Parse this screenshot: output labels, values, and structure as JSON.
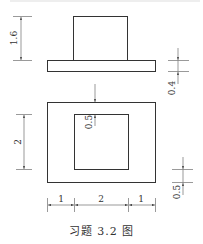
{
  "figure": {
    "caption": "习题 3.2 图",
    "line_color": "#333333",
    "front_view": {
      "dims": {
        "upper_height": "1.6",
        "base_thickness": "0.4"
      }
    },
    "top_view": {
      "dims": {
        "inner_height": "2",
        "top_offset": "0.5",
        "bottom_offset": "0.5",
        "left_width": "1",
        "middle_width": "2",
        "right_width": "1"
      }
    }
  }
}
